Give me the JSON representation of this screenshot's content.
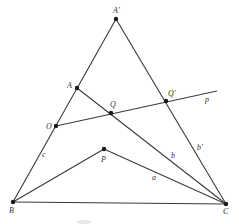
{
  "diagram": {
    "type": "geometry-figure",
    "colors": {
      "line": "#3a3a3a",
      "point": "#1a1a1a",
      "label": "#333333"
    },
    "points": {
      "A_prime": {
        "label": "A'",
        "x": 116,
        "y": 19
      },
      "A": {
        "label": "A",
        "x": 77,
        "y": 88
      },
      "O": {
        "label": "O",
        "x": 56,
        "y": 126
      },
      "Q": {
        "label": "Q",
        "x": 111,
        "y": 113
      },
      "Q_prime": {
        "label": "Q'",
        "x": 166,
        "y": 101
      },
      "P": {
        "label": "P",
        "x": 104,
        "y": 149
      },
      "B": {
        "label": "B",
        "x": 13,
        "y": 202
      },
      "C": {
        "label": "C",
        "x": 226,
        "y": 204
      }
    },
    "segments": [
      {
        "from": "B",
        "to": "A_prime"
      },
      {
        "from": "A_prime",
        "to": "C"
      },
      {
        "from": "B",
        "to": "C"
      },
      {
        "from": "A",
        "to": "C"
      },
      {
        "from": "B",
        "to": "P"
      },
      {
        "from": "P",
        "to": "C"
      }
    ],
    "lines": [
      {
        "name": "p",
        "from": "O",
        "through": "Q_prime",
        "end_x": 217,
        "end_y": 91
      }
    ],
    "edge_labels": {
      "c": "c",
      "b": "b",
      "b_prime": "b'",
      "a": "a",
      "p": "p"
    }
  }
}
